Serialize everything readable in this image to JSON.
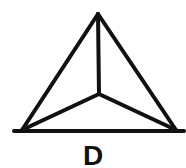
{
  "figure": {
    "label": "D",
    "shape": "triangle-with-center-point",
    "stroke_color": "#111111",
    "background": "#ffffff",
    "vertices": {
      "apex": [
        98,
        14
      ],
      "bottom_left": [
        22,
        130
      ],
      "bottom_right": [
        176,
        130
      ],
      "center": [
        99,
        94
      ]
    }
  }
}
